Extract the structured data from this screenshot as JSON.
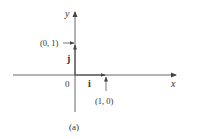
{
  "figure": {
    "caption": "(a)",
    "axes": {
      "x_label": "x",
      "y_label": "y",
      "origin_label": "0"
    },
    "vectors": [
      {
        "name": "i",
        "label": "i",
        "from": [
          0,
          0
        ],
        "to": [
          1,
          0
        ]
      },
      {
        "name": "j",
        "label": "j",
        "from": [
          0,
          0
        ],
        "to": [
          0,
          1
        ]
      }
    ],
    "points": [
      {
        "label": "(1, 0)"
      },
      {
        "label": "(0, 1)"
      }
    ],
    "colors": {
      "line": "#555555",
      "text": "#333333",
      "background": "#ffffff"
    }
  }
}
